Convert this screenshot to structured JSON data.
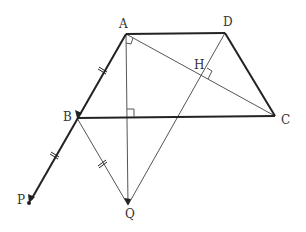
{
  "diagram": {
    "type": "geometry",
    "points": {
      "A": {
        "label": "A",
        "x": 126,
        "y": 34
      },
      "D": {
        "label": "D",
        "x": 225,
        "y": 33
      },
      "C": {
        "label": "C",
        "x": 275,
        "y": 116
      },
      "B": {
        "label": "B",
        "x": 77,
        "y": 118
      },
      "P": {
        "label": "P",
        "x": 29,
        "y": 203
      },
      "Q": {
        "label": "Q",
        "x": 128,
        "y": 205
      },
      "H": {
        "label": "H",
        "x": 202,
        "y": 77
      }
    },
    "labels": {
      "A": "A",
      "B": "B",
      "C": "C",
      "D": "D",
      "H": "H",
      "P": "P",
      "Q": "Q"
    },
    "segments": [
      {
        "from": "A",
        "to": "D",
        "style": "thick"
      },
      {
        "from": "D",
        "to": "C",
        "style": "thick"
      },
      {
        "from": "B",
        "to": "C",
        "style": "thick"
      },
      {
        "from": "A",
        "to": "P",
        "style": "thick-arrow"
      },
      {
        "from": "A",
        "to": "C",
        "style": "thin"
      },
      {
        "from": "A",
        "to": "Q",
        "style": "thin"
      },
      {
        "from": "D",
        "to": "Q",
        "style": "thin"
      },
      {
        "from": "B",
        "to": "Q",
        "style": "thin"
      }
    ],
    "right_angles": [
      "A (between AB and AC)",
      "AQ ⊥ BC",
      "DQ ⊥ AC at H"
    ],
    "equal_marks": [
      "AB",
      "BP",
      "BQ"
    ],
    "colors": {
      "line": "#222222",
      "thin": "#555555",
      "label": "#333333"
    }
  }
}
